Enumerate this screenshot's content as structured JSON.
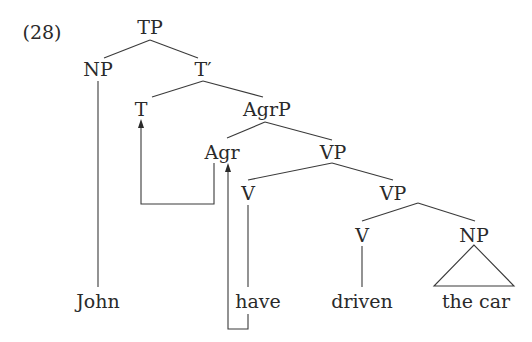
{
  "example_number": "(28)",
  "nodes": {
    "tp": {
      "label": "TP",
      "x": 150,
      "y": 27
    },
    "np_subj": {
      "label": "NP",
      "x": 98,
      "y": 69
    },
    "t_bar": {
      "label": "T′",
      "x": 203,
      "y": 69
    },
    "t": {
      "label": "T",
      "x": 141,
      "y": 109
    },
    "agrp": {
      "label": "AgrP",
      "x": 267,
      "y": 109
    },
    "agr": {
      "label": "Agr",
      "x": 222,
      "y": 152
    },
    "vp1": {
      "label": "VP",
      "x": 333,
      "y": 152
    },
    "v1": {
      "label": "V",
      "x": 248,
      "y": 193
    },
    "vp2": {
      "label": "VP",
      "x": 393,
      "y": 193
    },
    "v2": {
      "label": "V",
      "x": 362,
      "y": 235
    },
    "np_obj": {
      "label": "NP",
      "x": 474,
      "y": 235
    }
  },
  "leaves": {
    "john": {
      "label": "John",
      "x": 98,
      "y": 300
    },
    "have": {
      "label": "have",
      "x": 256,
      "y": 300
    },
    "driven": {
      "label": "driven",
      "x": 362,
      "y": 300
    },
    "the_car": {
      "label": "the car",
      "x": 476,
      "y": 300
    }
  },
  "movements": [
    {
      "from": "Agr",
      "to": "T",
      "description": "Agr raises to T"
    },
    {
      "from": "have",
      "to": "Agr",
      "description": "have raises to Agr"
    }
  ],
  "colors": {
    "line": "#3a3a3a",
    "text": "#2a2a2a",
    "background": "#ffffff"
  }
}
